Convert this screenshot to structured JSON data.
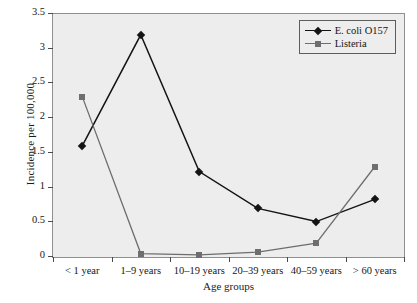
{
  "chart_data": {
    "type": "line",
    "title": "",
    "xlabel": "Age groups",
    "ylabel": "Incidence per 100,000",
    "categories": [
      "< 1 year",
      "1–9 years",
      "10–19 years",
      "20–39 years",
      "40–59 years",
      "> 60 years"
    ],
    "series": [
      {
        "name": "E. coli O157",
        "color": "#141414",
        "marker": "diamond",
        "values": [
          1.6,
          3.2,
          1.23,
          0.7,
          0.51,
          0.83
        ]
      },
      {
        "name": "Listeria",
        "color": "#6e6e6e",
        "marker": "square",
        "values": [
          2.31,
          0.05,
          0.03,
          0.07,
          0.2,
          1.3
        ]
      }
    ],
    "ylim": [
      0,
      3.5
    ],
    "yticks": [
      0,
      0.5,
      1,
      1.5,
      2,
      2.5,
      3,
      3.5
    ],
    "ytick_labels": [
      "0",
      "0.5",
      "1",
      "1.5",
      "2",
      "2.5",
      "3",
      "3.5"
    ],
    "grid": false,
    "legend_position": "top-right",
    "plot_background": "#ededed"
  },
  "axes": {
    "y_title": "Incidence per 100,000",
    "x_title": "Age groups"
  },
  "legend": {
    "entries": [
      {
        "label": "E. coli O157"
      },
      {
        "label": "Listeria"
      }
    ]
  },
  "caption": {
    "partial_text": ""
  }
}
